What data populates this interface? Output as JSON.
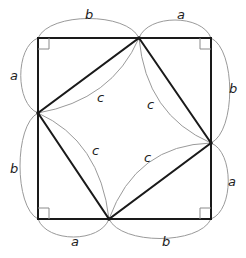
{
  "diagram": {
    "title": "",
    "colors": {
      "square_stroke": "#1a1a1a",
      "arc_stroke": "#9a9a9a",
      "label": "#222222",
      "background": "#ffffff"
    },
    "outer_square": {
      "corners": {
        "top_left": [
          38,
          38
        ],
        "top_right": [
          211,
          38
        ],
        "bottom_right": [
          211,
          219
        ],
        "bottom_left": [
          38,
          219
        ]
      }
    },
    "inner_square": {
      "vertices": {
        "top": [
          139,
          38
        ],
        "right": [
          211,
          143
        ],
        "bottom": [
          109,
          219
        ],
        "left": [
          38,
          113
        ]
      }
    },
    "labels": {
      "top_b": "b",
      "top_a": "a",
      "right_b": "b",
      "right_a": "a",
      "bottom_a": "a",
      "bottom_b": "b",
      "left_a": "a",
      "left_b": "b",
      "c_top_left": "c",
      "c_top_right": "c",
      "c_bottom_left": "c",
      "c_bottom_right": "c"
    }
  }
}
